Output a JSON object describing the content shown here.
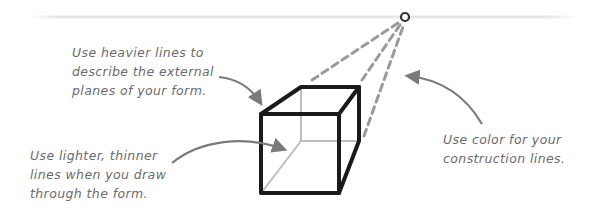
{
  "diagram": {
    "topic": "Drawing a cube in perspective",
    "colors": {
      "horizon": "#e6e6e6",
      "heavy_line": "#1a1a1a",
      "light_line": "#bdbdbd",
      "construction": "#9a9a9a",
      "annotation": "#6b6b6b",
      "arrow": "#7a7a7a"
    },
    "annotations": [
      {
        "id": "heavier-lines",
        "lines": [
          "Use heavier lines to",
          "describe the external",
          "planes of your form."
        ]
      },
      {
        "id": "lighter-lines",
        "lines": [
          "Use lighter, thinner",
          "lines when you draw",
          "through the form."
        ]
      },
      {
        "id": "construction-color",
        "lines": [
          "Use color for your",
          "construction lines."
        ]
      }
    ],
    "elements": {
      "horizon_line": "horizon line",
      "vanishing_point": "vanishing point",
      "cube": "cube in one-point perspective"
    }
  }
}
